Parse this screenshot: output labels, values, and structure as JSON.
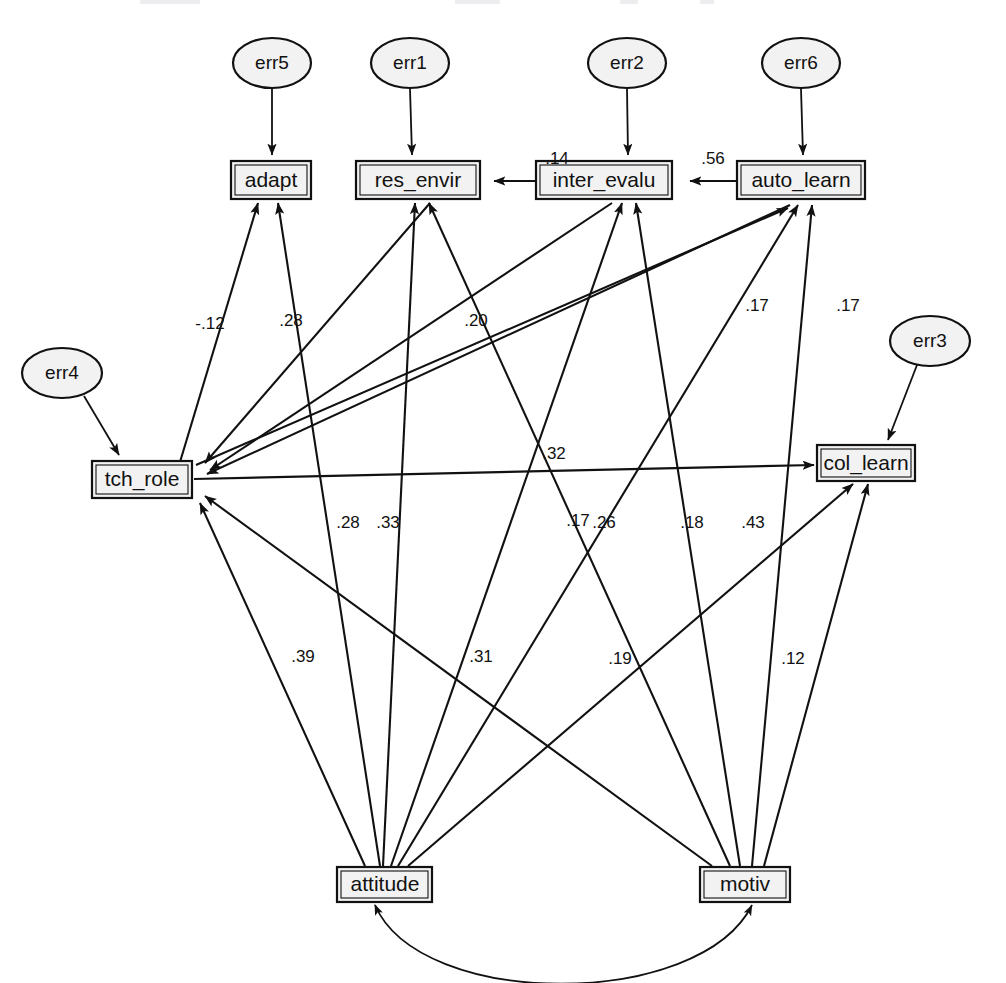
{
  "diagram": {
    "type": "structural-equation-model-path-diagram",
    "title": "",
    "observed_variables": [
      {
        "id": "adapt",
        "label": "adapt",
        "x": 271,
        "y": 180,
        "w": 80,
        "h": 37
      },
      {
        "id": "res_envir",
        "label": "res_envir",
        "x": 418,
        "y": 180,
        "w": 124,
        "h": 37
      },
      {
        "id": "inter_evalu",
        "label": "inter_evalu",
        "x": 604,
        "y": 180,
        "w": 136,
        "h": 37
      },
      {
        "id": "auto_learn",
        "label": "auto_learn",
        "x": 801,
        "y": 180,
        "w": 128,
        "h": 37
      },
      {
        "id": "tch_role",
        "label": "tch_role",
        "x": 142,
        "y": 479,
        "w": 100,
        "h": 36
      },
      {
        "id": "col_learn",
        "label": "col_learn",
        "x": 866,
        "y": 463,
        "w": 98,
        "h": 35
      },
      {
        "id": "attitude",
        "label": "attitude",
        "x": 385,
        "y": 884,
        "w": 95,
        "h": 34
      },
      {
        "id": "motiv",
        "label": "motiv",
        "x": 745,
        "y": 884,
        "w": 90,
        "h": 34
      }
    ],
    "error_terms": [
      {
        "id": "err5",
        "label": "err5",
        "cx": 272,
        "cy": 63,
        "rx": 39,
        "ry": 25,
        "target": "adapt"
      },
      {
        "id": "err1",
        "label": "err1",
        "cx": 410,
        "cy": 63,
        "rx": 39,
        "ry": 25,
        "target": "res_envir"
      },
      {
        "id": "err2",
        "label": "err2",
        "cx": 627,
        "cy": 63,
        "rx": 39,
        "ry": 25,
        "target": "inter_evalu"
      },
      {
        "id": "err6",
        "label": "err6",
        "cx": 801,
        "cy": 63,
        "rx": 39,
        "ry": 25,
        "target": "auto_learn"
      },
      {
        "id": "err4",
        "label": "err4",
        "cx": 62,
        "cy": 373,
        "rx": 40,
        "ry": 25,
        "target": "tch_role"
      },
      {
        "id": "err3",
        "label": "err3",
        "cx": 930,
        "cy": 341,
        "rx": 40,
        "ry": 25,
        "target": "col_learn"
      }
    ],
    "paths": [
      {
        "from": "inter_evalu",
        "to": "res_envir",
        "coefficient": ".14",
        "label_x": 557,
        "label_y": 160
      },
      {
        "from": "auto_learn",
        "to": "inter_evalu",
        "coefficient": ".56",
        "label_x": 713,
        "label_y": 160
      },
      {
        "from": "tch_role",
        "to": "adapt",
        "coefficient": "-.12",
        "label_x": 210,
        "label_y": 325
      },
      {
        "from": "attitude",
        "to": "adapt",
        "coefficient": ".28",
        "label_x": 291,
        "label_y": 322
      },
      {
        "from": "tch_role",
        "to": "auto_learn",
        "coefficient": ".20",
        "label_x": 476,
        "label_y": 322
      },
      {
        "from": "attitude",
        "to": "auto_learn",
        "coefficient": ".17",
        "label_x": 757,
        "label_y": 307
      },
      {
        "from": "motiv",
        "to": "auto_learn",
        "coefficient": ".17",
        "label_x": 848,
        "label_y": 307
      },
      {
        "from": "tch_role",
        "to": "col_learn",
        "coefficient": ".32",
        "label_x": 554,
        "label_y": 455
      },
      {
        "from": "attitude",
        "to": "res_envir",
        "coefficient": ".28",
        "label_x": 348,
        "label_y": 524
      },
      {
        "from": "attitude",
        "to": "inter_evalu",
        "coefficient": ".33",
        "label_x": 388,
        "label_y": 524
      },
      {
        "from": "attitude",
        "to": "col_learn",
        "coefficient": ".17",
        "label_x": 578,
        "label_y": 522
      },
      {
        "from": "motiv",
        "to": "res_envir",
        "coefficient": ".26",
        "label_x": 604,
        "label_y": 524
      },
      {
        "from": "motiv",
        "to": "inter_evalu",
        "coefficient": ".18",
        "label_x": 692,
        "label_y": 524
      },
      {
        "from": "motiv",
        "to": "col_learn",
        "coefficient": ".43",
        "label_x": 753,
        "label_y": 524
      },
      {
        "from": "attitude",
        "to": "tch_role",
        "coefficient": ".39",
        "label_x": 303,
        "label_y": 658
      },
      {
        "from": "motiv",
        "to": "tch_role",
        "coefficient": ".31",
        "label_x": 481,
        "label_y": 658
      },
      {
        "from": "attitude",
        "to": "col_learn",
        "coefficient": ".19",
        "label_x": 620,
        "label_y": 660
      },
      {
        "from": "motiv",
        "to": "col_learn",
        "coefficient": ".12",
        "label_x": 793,
        "label_y": 660
      }
    ],
    "covariances": [
      {
        "between": [
          "attitude",
          "motiv"
        ],
        "coefficient": "",
        "style": "double-headed-curved"
      }
    ],
    "colors": {
      "node_fill": "#f2f2f2",
      "stroke": "#111111",
      "background": "#ffffff"
    }
  }
}
